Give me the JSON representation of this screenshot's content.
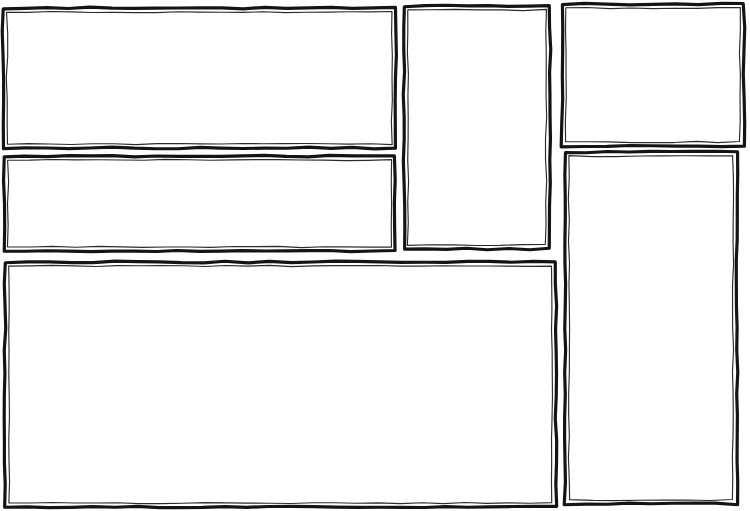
{
  "document": {
    "title": "Hand-drawn wireframe layout sketch",
    "kind": "wireframe-sketch",
    "width": 750,
    "height": 511,
    "background_color": "#ffffff",
    "stroke_color": "#141414",
    "stroke_inner_color": "#2b2b2b",
    "notes": "All regions are empty placeholder boxes with no text, icons or content inside."
  },
  "layout": {
    "columns": [
      {
        "name": "left-column",
        "x_range": [
          3,
          396
        ]
      },
      {
        "name": "middle-column",
        "x_range": [
          404,
          550
        ]
      },
      {
        "name": "right-column",
        "x_range": [
          562,
          744
        ]
      }
    ],
    "region_count": 6
  },
  "regions": [
    {
      "id": "region-1",
      "name": "top-left-panel",
      "label": "",
      "column": "left-column",
      "x": 3,
      "y": 8,
      "width": 393,
      "height": 140,
      "stroke_width": 3.2,
      "inner_offset": 4
    },
    {
      "id": "region-2",
      "name": "mid-left-panel",
      "label": "",
      "column": "left-column",
      "x": 4,
      "y": 156,
      "width": 391,
      "height": 95,
      "stroke_width": 3.2,
      "inner_offset": 4
    },
    {
      "id": "region-3",
      "name": "bottom-left-panel",
      "label": "",
      "column": "left-column",
      "x": 5,
      "y": 262,
      "width": 551,
      "height": 245,
      "stroke_width": 3.2,
      "inner_offset": 4
    },
    {
      "id": "region-4",
      "name": "middle-tall-panel",
      "label": "",
      "column": "middle-column",
      "x": 404,
      "y": 6,
      "width": 146,
      "height": 243,
      "stroke_width": 3.2,
      "inner_offset": 4
    },
    {
      "id": "region-5",
      "name": "top-right-panel",
      "label": "",
      "column": "right-column",
      "x": 562,
      "y": 4,
      "width": 182,
      "height": 142,
      "stroke_width": 3.2,
      "inner_offset": 4
    },
    {
      "id": "region-6",
      "name": "bottom-right-panel",
      "label": "",
      "column": "right-column",
      "x": 565,
      "y": 152,
      "width": 172,
      "height": 352,
      "stroke_width": 3.2,
      "inner_offset": 4
    }
  ]
}
